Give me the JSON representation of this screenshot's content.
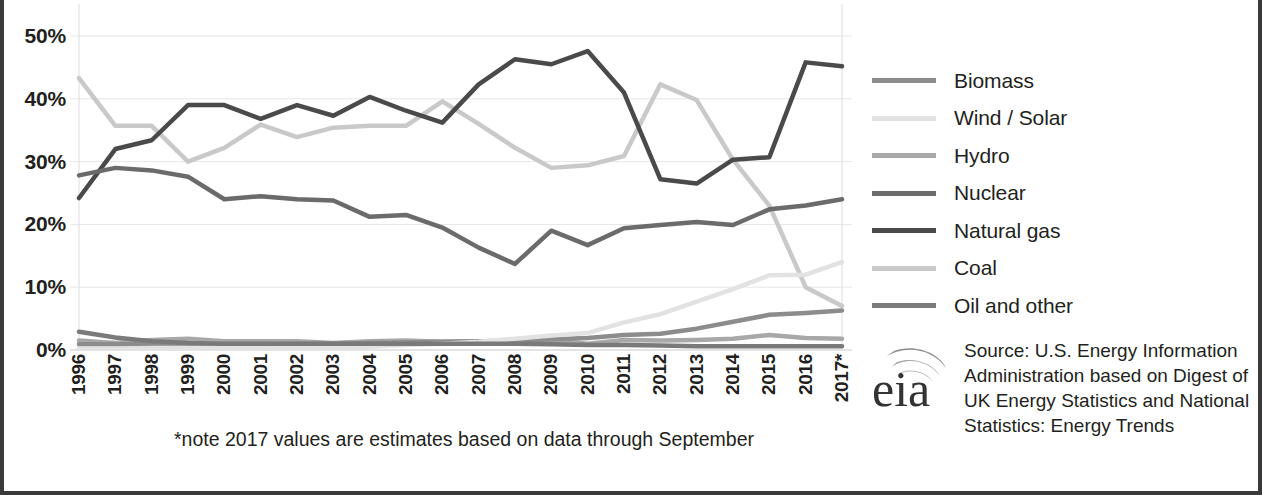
{
  "axes": {
    "y_ticks": [
      "50%",
      "40%",
      "30%",
      "20%",
      "10%",
      "0%"
    ],
    "y_label": "",
    "x_label": ""
  },
  "footnote": "*note 2017 values are estimates based on data through September",
  "legend": {
    "items": [
      {
        "label": "Biomass",
        "color": "#8c8c8c"
      },
      {
        "label": "Wind / Solar",
        "color": "#e2e2e2"
      },
      {
        "label": "Hydro",
        "color": "#a8a8a8"
      },
      {
        "label": "Nuclear",
        "color": "#6b6b6b"
      },
      {
        "label": "Natural gas",
        "color": "#4a4a4a"
      },
      {
        "label": "Coal",
        "color": "#c9c9c9"
      },
      {
        "label": "Oil and other",
        "color": "#7a7a7a"
      }
    ]
  },
  "source": {
    "logo_text": "eia",
    "text": "Source: U.S. Energy Information Administration based on Digest of UK Energy Statistics and National Statistics: Energy Trends"
  },
  "chart_data": {
    "type": "line",
    "title": "",
    "subtitle": "",
    "xlabel": "",
    "ylabel": "",
    "grid": true,
    "legend_position": "right",
    "ylim": [
      0,
      50
    ],
    "yticks": [
      0,
      10,
      20,
      30,
      40,
      50
    ],
    "ytick_labels": [
      "0%",
      "10%",
      "20%",
      "30%",
      "40%",
      "50%"
    ],
    "x": [
      1996,
      1997,
      1998,
      1999,
      2000,
      2001,
      2002,
      2003,
      2004,
      2005,
      2006,
      2007,
      2008,
      2009,
      2010,
      2011,
      2012,
      2013,
      2014,
      2015,
      2016,
      2017
    ],
    "xtick_labels": [
      "1996",
      "1997",
      "1998",
      "1999",
      "2000",
      "2001",
      "2002",
      "2003",
      "2004",
      "2005",
      "2006",
      "2007",
      "2008",
      "2009",
      "2010",
      "2011",
      "2012",
      "2013",
      "2014",
      "2015",
      "2016",
      "2017*"
    ],
    "series": [
      {
        "name": "Coal",
        "color": "#c9c9c9",
        "values": [
          43.3,
          35.7,
          35.7,
          30.0,
          32.2,
          35.9,
          33.9,
          35.4,
          35.7,
          35.7,
          39.6,
          36.0,
          32.2,
          29.0,
          29.4,
          30.9,
          42.3,
          39.8,
          30.3,
          23.0,
          10.0,
          7.0
        ]
      },
      {
        "name": "Natural gas",
        "color": "#4a4a4a",
        "values": [
          24.2,
          32.0,
          33.4,
          39.0,
          39.0,
          36.8,
          39.0,
          37.3,
          40.3,
          38.1,
          36.2,
          42.3,
          46.3,
          45.5,
          47.6,
          41.0,
          27.2,
          26.5,
          30.3,
          30.7,
          45.8,
          45.2
        ]
      },
      {
        "name": "Nuclear",
        "color": "#6b6b6b",
        "values": [
          27.8,
          29.0,
          28.6,
          27.6,
          24.0,
          24.5,
          24.0,
          23.8,
          21.2,
          21.5,
          19.5,
          16.3,
          13.7,
          19.0,
          16.7,
          19.4,
          19.9,
          20.4,
          19.9,
          22.4,
          23.0,
          24.0
        ]
      },
      {
        "name": "Hydro",
        "color": "#a8a8a8",
        "values": [
          1.5,
          1.1,
          1.6,
          1.8,
          1.4,
          1.4,
          1.4,
          1.1,
          1.4,
          1.5,
          1.3,
          1.4,
          1.4,
          1.5,
          1.0,
          1.6,
          1.5,
          1.6,
          1.8,
          2.4,
          1.9,
          1.8
        ]
      },
      {
        "name": "Biomass",
        "color": "#8c8c8c",
        "values": [
          0.9,
          0.9,
          0.9,
          0.9,
          0.9,
          0.9,
          1.0,
          1.0,
          1.1,
          1.2,
          1.3,
          1.4,
          1.5,
          1.7,
          1.9,
          2.4,
          2.6,
          3.4,
          4.5,
          5.6,
          5.9,
          6.3
        ]
      },
      {
        "name": "Wind / Solar",
        "color": "#e2e2e2",
        "values": [
          0.2,
          0.2,
          0.3,
          0.3,
          0.3,
          0.3,
          0.4,
          0.4,
          0.5,
          0.8,
          1.0,
          1.3,
          1.8,
          2.3,
          2.7,
          4.4,
          5.7,
          7.7,
          9.7,
          11.9,
          12.0,
          14.0
        ]
      },
      {
        "name": "Oil and other",
        "color": "#7a7a7a",
        "values": [
          2.9,
          2.0,
          1.4,
          1.1,
          1.0,
          1.0,
          1.0,
          1.0,
          1.0,
          1.0,
          1.0,
          1.0,
          1.0,
          0.9,
          0.8,
          0.8,
          0.7,
          0.6,
          0.6,
          0.6,
          0.6,
          0.6
        ]
      }
    ]
  }
}
